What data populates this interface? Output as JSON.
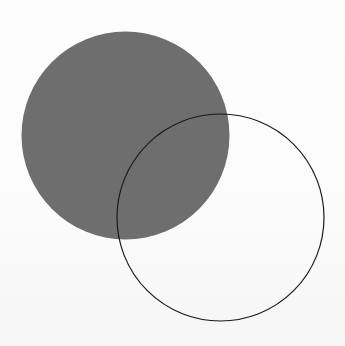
{
  "diagram": {
    "title": "",
    "shapes": [
      {
        "id": "filled-circle",
        "kind": "circle",
        "style": "filled",
        "fill": "#6e6e6e",
        "stroke": "none"
      },
      {
        "id": "outline-circle",
        "kind": "circle",
        "style": "outline",
        "fill": "none",
        "stroke": "#1a1a1a"
      }
    ],
    "relationship": "overlapping"
  }
}
